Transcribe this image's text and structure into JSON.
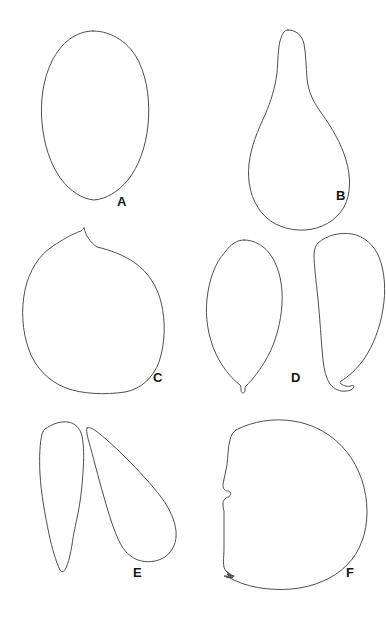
{
  "figure": {
    "kind": "botanical-line-drawing-plate",
    "background_color": "#ffffff",
    "stroke_color": "#4f4f4f",
    "label_color": "#161616",
    "width": 386,
    "height": 626,
    "columns": 2,
    "rows": 3
  },
  "panels": [
    {
      "label": "A",
      "label_x": 117,
      "label_y": 206,
      "description": "elongated ovoid outline, broadest above middle, tapering to a narrow rounded base",
      "specimen_count": 1,
      "row": 1,
      "column": 1
    },
    {
      "label": "B",
      "label_x": 336,
      "label_y": 200,
      "description": "pear-shaped outline with narrow rounded neck at apex widening to a broad rounded base",
      "specimen_count": 1,
      "row": 1,
      "column": 2
    },
    {
      "label": "C",
      "label_x": 153,
      "label_y": 382,
      "description": "broad rounded, almost circular outline with a small sharp pointed apex at top",
      "specimen_count": 1,
      "row": 2,
      "column": 1
    },
    {
      "label": "D",
      "label_x": 291,
      "label_y": 382,
      "description": "two elongated oval outlines side by side, each with a small beak-like tail at the base",
      "specimen_count": 2,
      "row": 2,
      "column": 2
    },
    {
      "label": "E",
      "label_x": 133,
      "label_y": 577,
      "description": "two narrow elongated outlines, one upright with a pointed base, one tilted diagonally",
      "specimen_count": 2,
      "row": 3,
      "column": 1
    },
    {
      "label": "F",
      "label_x": 346,
      "label_y": 577,
      "description": "large broad rounded outline with a small notched indentation on the left margin",
      "specimen_count": 1,
      "row": 3,
      "column": 2
    }
  ]
}
